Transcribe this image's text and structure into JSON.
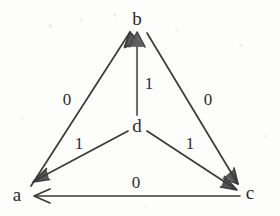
{
  "figure": {
    "type": "directed-graph",
    "background_color": "#fdfdfc",
    "ink_color": "#3a3a3a",
    "text_color": "#2b2b2b",
    "width": 280,
    "height": 216
  },
  "nodes": [
    {
      "id": "b",
      "label": "b",
      "x": 137,
      "y": 18
    },
    {
      "id": "d",
      "label": "d",
      "x": 137,
      "y": 125
    },
    {
      "id": "a",
      "label": "a",
      "x": 17,
      "y": 194
    },
    {
      "id": "c",
      "label": "c",
      "x": 250,
      "y": 192
    }
  ],
  "edges": [
    {
      "id": "a-to-b",
      "from": "a",
      "to": "b",
      "label": "0",
      "x1": 31,
      "y1": 186,
      "x2": 130,
      "y2": 32,
      "label_x": 67,
      "label_y": 99
    },
    {
      "id": "b-to-c",
      "from": "b",
      "to": "c",
      "label": "0",
      "x1": 147,
      "y1": 33,
      "x2": 238,
      "y2": 184,
      "label_x": 208,
      "label_y": 99
    },
    {
      "id": "d-to-b",
      "from": "d",
      "to": "b",
      "label": "1",
      "x1": 137,
      "y1": 115,
      "x2": 137,
      "y2": 33,
      "label_x": 149,
      "label_y": 83
    },
    {
      "id": "d-to-a",
      "from": "d",
      "to": "a",
      "label": "1",
      "x1": 128,
      "y1": 131,
      "x2": 34,
      "y2": 181,
      "label_x": 79,
      "label_y": 143
    },
    {
      "id": "d-to-c",
      "from": "d",
      "to": "c",
      "label": "1",
      "x1": 147,
      "y1": 131,
      "x2": 236,
      "y2": 189,
      "label_x": 190,
      "label_y": 143
    },
    {
      "id": "c-to-a",
      "from": "c",
      "to": "a",
      "label": "0",
      "x1": 240,
      "y1": 196,
      "x2": 34,
      "y2": 196,
      "label_x": 136,
      "label_y": 182
    }
  ]
}
